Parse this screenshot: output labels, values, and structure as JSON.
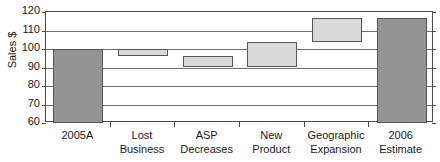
{
  "chart_data": {
    "type": "bar",
    "subtype": "waterfall",
    "title": "",
    "xlabel": "",
    "ylabel": "Sales $",
    "ylim": [
      60,
      120
    ],
    "ytick_step": 10,
    "yticks": [
      120,
      110,
      100,
      90,
      80,
      70,
      60
    ],
    "grid": true,
    "legend": "none",
    "categories": [
      "2005A",
      "Lost Business",
      "ASP Decreases",
      "New Product",
      "Geographic Expansion",
      "2006 Estimate"
    ],
    "category_lines": [
      [
        "2005A"
      ],
      [
        "Lost",
        "Business"
      ],
      [
        "ASP",
        "Decreases"
      ],
      [
        "New",
        "Product"
      ],
      [
        "Geographic",
        "Expansion"
      ],
      [
        "2006",
        "Estimate"
      ]
    ],
    "bars": [
      {
        "label": "2005A",
        "kind": "total",
        "base": 60,
        "top": 100,
        "value": 100,
        "color": "#949494"
      },
      {
        "label": "Lost Business",
        "kind": "delta",
        "base": 96,
        "top": 100,
        "value": -4,
        "color": "#d9d9d9"
      },
      {
        "label": "ASP Decreases",
        "kind": "delta",
        "base": 90,
        "top": 96,
        "value": -6,
        "color": "#d9d9d9"
      },
      {
        "label": "New Product",
        "kind": "delta",
        "base": 90,
        "top": 104,
        "value": 14,
        "color": "#d9d9d9"
      },
      {
        "label": "Geographic Expansion",
        "kind": "delta",
        "base": 104,
        "top": 117,
        "value": 13,
        "color": "#d9d9d9"
      },
      {
        "label": "2006 Estimate",
        "kind": "total",
        "base": 60,
        "top": 117,
        "value": 117,
        "color": "#949494"
      }
    ],
    "colors": {
      "endpoint_bar": "#949494",
      "delta_bar": "#d9d9d9",
      "bar_border": "#555555",
      "gridline": "#6e6e6e",
      "axis": "#4a4a4a",
      "text": "#1a1a1a",
      "background": "#ffffff"
    }
  }
}
